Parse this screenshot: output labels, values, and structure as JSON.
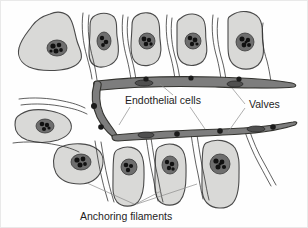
{
  "figure": {
    "background_color": "#fefefe",
    "border_color": "#e9e9e9"
  },
  "labels": {
    "endothelial_cells": "Endothelial cells",
    "valves": "Valves",
    "anchoring_filaments": "Anchoring filaments"
  },
  "colors": {
    "cell_fill": "#d9d9d7",
    "cell_outline": "#4a4a4a",
    "nucleus_fill": "#6e6e6e",
    "chromatin": "#111111",
    "vessel_fill": "#7d7d7d",
    "vessel_outline": "#33332f",
    "valve_cell": "#4f4f4f",
    "attachment_knob": "#1a1a1a",
    "filament": "#2b2b2b",
    "leader_line": "#8d8d8d",
    "text": "#1d1d1d"
  },
  "structures": {
    "tissue_cells_count": 12,
    "valve_cells_count": 4,
    "attachment_knobs_count": 9,
    "vessel_segments": 2
  }
}
